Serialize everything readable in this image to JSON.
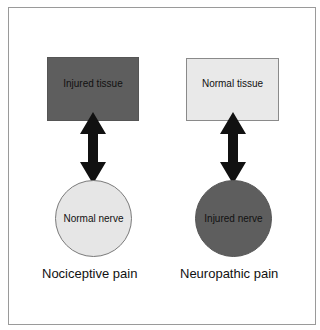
{
  "diagram": {
    "left": {
      "top_box": {
        "label": "Injured tissue",
        "fill": "#5e5e5e"
      },
      "bottom_circle": {
        "label": "Normal nerve",
        "fill": "#e6e6e6"
      },
      "caption": "Nociceptive pain"
    },
    "right": {
      "top_box": {
        "label": "Normal tissue",
        "fill": "#e9e9e9"
      },
      "bottom_circle": {
        "label": "Injured nerve",
        "fill": "#5e5e5e"
      },
      "caption": "Neuropathic pain"
    },
    "arrow_color": "#111111",
    "arrow_type": "bidirectional"
  }
}
